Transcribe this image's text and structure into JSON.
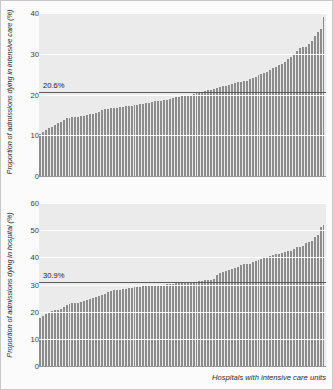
{
  "figure": {
    "xlabel": "Hospitals with intensive care units"
  },
  "chart_data": [
    {
      "type": "bar",
      "panel": "top",
      "title": "",
      "ylabel": "Proportion of admissions dying in intensive care (%)",
      "xlabel": "",
      "ylim": [
        0,
        40
      ],
      "yticks": [
        0,
        10,
        20,
        30,
        40
      ],
      "ytick_labels": [
        "0",
        "10",
        "20",
        "30",
        "40"
      ],
      "grid": true,
      "legend": "none",
      "bar_color": "#8c8c8c",
      "plot_background": "#ebebeb",
      "reference_line": {
        "value": 20.6,
        "label": "20.6%",
        "color": "#5a5a5a"
      },
      "categories_note": "Hospitals with intensive care units, sorted ascending",
      "values": [
        10.4,
        10.9,
        11.4,
        11.8,
        12.1,
        12.4,
        12.9,
        13.2,
        13.8,
        14.2,
        14.3,
        14.4,
        14.5,
        14.6,
        14.7,
        14.8,
        15.0,
        15.1,
        15.3,
        15.4,
        15.6,
        16.2,
        16.4,
        16.5,
        16.6,
        16.7,
        16.8,
        16.9,
        17.0,
        17.1,
        17.2,
        17.3,
        17.4,
        17.5,
        17.6,
        17.7,
        17.8,
        17.9,
        18.1,
        18.3,
        18.4,
        18.5,
        18.6,
        18.7,
        18.9,
        19.1,
        19.3,
        19.5,
        19.6,
        19.7,
        19.9,
        20.0,
        20.1,
        20.3,
        20.4,
        20.6,
        20.8,
        21.0,
        21.2,
        21.4,
        21.6,
        21.8,
        22.0,
        22.2,
        22.4,
        22.6,
        22.8,
        23.0,
        23.1,
        23.2,
        23.4,
        23.7,
        24.1,
        24.4,
        24.7,
        25.0,
        25.3,
        25.6,
        26.0,
        26.4,
        26.8,
        27.2,
        27.6,
        28.0,
        28.6,
        29.2,
        29.8,
        30.6,
        31.3,
        31.6,
        31.7,
        32.5,
        33.2,
        34.3,
        35.4,
        36.2,
        39.1
      ]
    },
    {
      "type": "bar",
      "panel": "bottom",
      "title": "",
      "ylabel": "Proportion of admissions dying in hospital (%)",
      "xlabel": "Hospitals with intensive care units",
      "ylim": [
        0,
        60
      ],
      "yticks": [
        0,
        10,
        20,
        30,
        40,
        50,
        60
      ],
      "ytick_labels": [
        "0",
        "10",
        "20",
        "30",
        "40",
        "50",
        "60"
      ],
      "grid": true,
      "legend": "none",
      "bar_color": "#8c8c8c",
      "plot_background": "#ebebeb",
      "reference_line": {
        "value": 30.9,
        "label": "30.9%",
        "color": "#5a5a5a"
      },
      "categories_note": "Hospitals with intensive care units, sorted ascending",
      "values": [
        17.5,
        18.3,
        19.2,
        19.9,
        20.4,
        20.5,
        20.6,
        21.1,
        21.8,
        22.4,
        22.8,
        23.1,
        23.2,
        23.3,
        23.4,
        23.8,
        24.2,
        24.6,
        25.0,
        25.4,
        25.8,
        26.2,
        26.6,
        27.3,
        27.6,
        27.8,
        27.9,
        28.0,
        28.2,
        28.4,
        28.6,
        28.8,
        29.0,
        29.1,
        29.2,
        29.3,
        29.4,
        29.5,
        29.6,
        29.7,
        29.8,
        29.9,
        30.0,
        30.1,
        30.2,
        30.3,
        30.4,
        30.5,
        30.6,
        30.7,
        30.8,
        30.9,
        31.0,
        31.1,
        31.2,
        31.3,
        31.5,
        31.6,
        31.7,
        31.9,
        33.5,
        34.2,
        34.6,
        35.0,
        35.4,
        35.8,
        36.2,
        36.6,
        37.0,
        37.4,
        37.5,
        37.6,
        38.3,
        38.6,
        39.0,
        39.3,
        39.6,
        40.0,
        40.4,
        40.8,
        41.2,
        41.4,
        41.6,
        42.0,
        42.3,
        42.4,
        43.2,
        43.8,
        43.9,
        44.3,
        45.2,
        45.6,
        46.0,
        47.6,
        48.1,
        51.0,
        52.0
      ]
    }
  ]
}
